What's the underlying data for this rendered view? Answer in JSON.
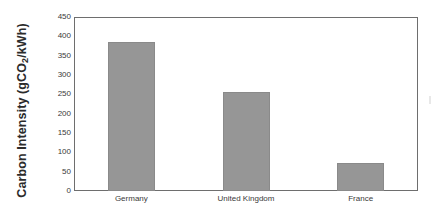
{
  "chart_data": {
    "type": "bar",
    "title": "",
    "xlabel": "",
    "ylabel_parts": {
      "before": "Carbon Intensity  (gCO",
      "subscript": "2",
      "after": "/kWh)"
    },
    "ylabel": "Carbon Intensity  (gCO2/kWh)",
    "categories": [
      "Germany",
      "United Kingdom",
      "France"
    ],
    "values": [
      385,
      256,
      72
    ],
    "ylim": [
      0,
      450
    ],
    "ytick_values": [
      0,
      50,
      100,
      150,
      200,
      250,
      300,
      350,
      400,
      450
    ],
    "ytick_labels": [
      "0",
      "50",
      "100",
      "150",
      "200",
      "250",
      "300",
      "350",
      "400",
      "450"
    ],
    "grid": false,
    "legend": null,
    "bar_color": "#969696",
    "bar_edge_color": "#8a8a8a",
    "frame_color": "#6e6e6e",
    "background_color": "#ffffff",
    "text_color": "#3a3a3a"
  }
}
